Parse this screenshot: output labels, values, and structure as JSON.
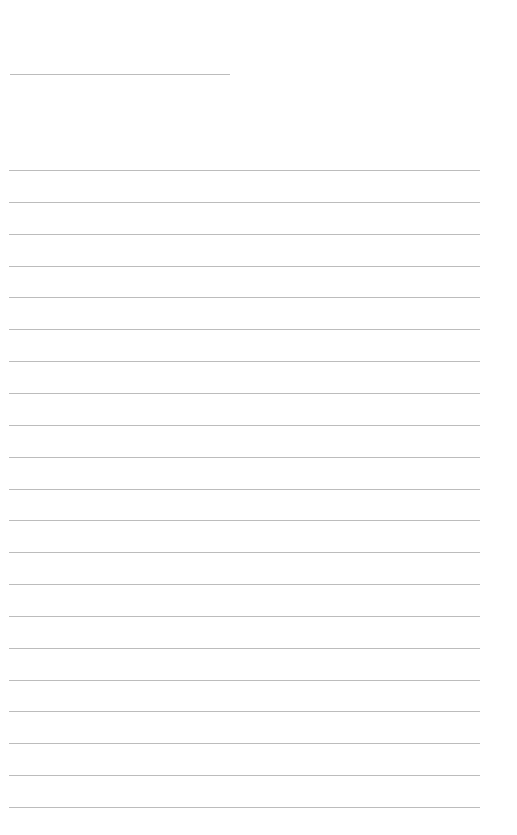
{
  "page": {
    "type": "lined-paper",
    "background_color": "#ffffff",
    "line_color": "#bcbcbc",
    "title_line": {
      "x1": 10,
      "x2": 230,
      "y": 74
    },
    "ruled_lines": {
      "count": 21,
      "first_y": 170,
      "spacing": 31.85,
      "x1": 9,
      "x2": 480
    }
  }
}
